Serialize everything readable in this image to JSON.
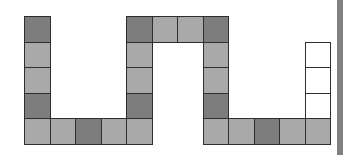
{
  "board": {
    "cell_size": 25.5,
    "origin": {
      "x": 24,
      "y": 16
    },
    "colors": {
      "dark": "#7d7d7d",
      "light": "#a9a9a9",
      "empty": "#ffffff",
      "border": "#2e2e2e"
    },
    "path_cells": [
      {
        "col": 0,
        "row": 0,
        "shade": "dark"
      },
      {
        "col": 0,
        "row": 1,
        "shade": "light"
      },
      {
        "col": 0,
        "row": 2,
        "shade": "light"
      },
      {
        "col": 0,
        "row": 3,
        "shade": "dark"
      },
      {
        "col": 0,
        "row": 4,
        "shade": "light"
      },
      {
        "col": 1,
        "row": 4,
        "shade": "light"
      },
      {
        "col": 2,
        "row": 4,
        "shade": "dark"
      },
      {
        "col": 3,
        "row": 4,
        "shade": "light"
      },
      {
        "col": 4,
        "row": 4,
        "shade": "light"
      },
      {
        "col": 4,
        "row": 3,
        "shade": "dark"
      },
      {
        "col": 4,
        "row": 2,
        "shade": "light"
      },
      {
        "col": 4,
        "row": 1,
        "shade": "light"
      },
      {
        "col": 4,
        "row": 0,
        "shade": "dark"
      },
      {
        "col": 5,
        "row": 0,
        "shade": "light"
      },
      {
        "col": 6,
        "row": 0,
        "shade": "light"
      },
      {
        "col": 7,
        "row": 0,
        "shade": "dark"
      },
      {
        "col": 7,
        "row": 1,
        "shade": "light"
      },
      {
        "col": 7,
        "row": 2,
        "shade": "light"
      },
      {
        "col": 7,
        "row": 3,
        "shade": "dark"
      },
      {
        "col": 7,
        "row": 4,
        "shade": "light"
      },
      {
        "col": 8,
        "row": 4,
        "shade": "light"
      },
      {
        "col": 9,
        "row": 4,
        "shade": "dark"
      },
      {
        "col": 10,
        "row": 4,
        "shade": "light"
      },
      {
        "col": 11,
        "row": 4,
        "shade": "light"
      },
      {
        "col": 11,
        "row": 3,
        "shade": "empty"
      },
      {
        "col": 11,
        "row": 2,
        "shade": "empty"
      },
      {
        "col": 11,
        "row": 1,
        "shade": "empty"
      }
    ]
  },
  "sidebar": {
    "color": "#808080"
  }
}
